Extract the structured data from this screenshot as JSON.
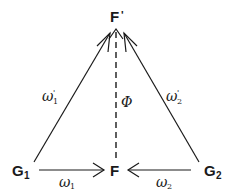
{
  "diagram": {
    "type": "commutative-diagram",
    "nodes": {
      "top": {
        "label": "F",
        "mark": "'"
      },
      "left": {
        "label": "G",
        "sub": "1"
      },
      "center": {
        "label": "F"
      },
      "right": {
        "label": "G",
        "sub": "2"
      }
    },
    "edges": {
      "left_diag": {
        "from": "G1",
        "to": "F'",
        "label": "ω",
        "sub": "1",
        "sup": "'"
      },
      "right_diag": {
        "from": "G2",
        "to": "F'",
        "label": "ω",
        "sub": "2",
        "sup": "'"
      },
      "vertical": {
        "from": "F",
        "to": "F'",
        "label": "Φ",
        "style": "dashed"
      },
      "bottom_left": {
        "from": "G1",
        "to": "F",
        "label": "ω",
        "sub": "1"
      },
      "bottom_right": {
        "from": "G2",
        "to": "F",
        "label": "ω",
        "sub": "2"
      }
    },
    "colors": {
      "ink": "#1a1a1a",
      "background": "#ffffff"
    }
  }
}
